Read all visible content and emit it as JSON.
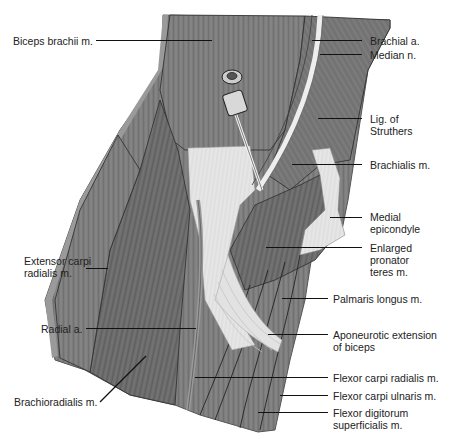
{
  "figure": {
    "colors": {
      "muscle": "#7a7a7a",
      "muscle_dark": "#5e5e5e",
      "muscle_light": "#9a9a9a",
      "tendon": "#e4e4e4",
      "outline": "#333333",
      "label_text": "#222222",
      "leader_line": "#111111",
      "background": "#ffffff"
    }
  },
  "labels": {
    "biceps_brachii": "Biceps brachii m.",
    "brachial_a": "Brachial a.",
    "median_n": "Median n.",
    "lig_struthers": "Lig. of\nStruthers",
    "brachialis": "Brachialis m.",
    "medial_epicondyle": "Medial\nepicondyle",
    "enlarged_pronator": "Enlarged\npronator\nteres m.",
    "extensor_carpi": "Extensor carpi\nradialis m.",
    "palmaris_longus": "Palmaris longus m.",
    "radial_a": "Radial a.",
    "aponeurotic": "Aponeurotic extension\nof biceps",
    "brachioradialis": "Brachioradialis m.",
    "flexor_carpi_radialis": "Flexor carpi radialis m.",
    "flexor_carpi_ulnaris": "Flexor carpi ulnaris m.",
    "flexor_digitorum": "Flexor digitorum\nsuperficialis m."
  }
}
